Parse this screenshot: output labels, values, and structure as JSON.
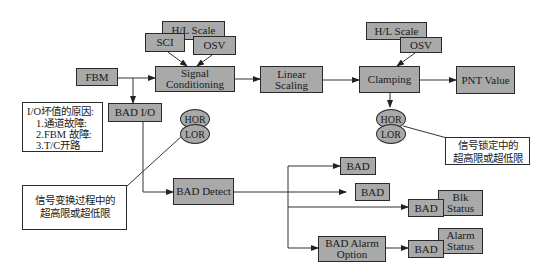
{
  "diagram": {
    "blocks": {
      "hl_scale_1": "H/L Scale",
      "sci": "SCI",
      "osv_1": "OSV",
      "fbm": "FBM",
      "signal_conditioning_l1": "Signal",
      "signal_conditioning_l2": "Conditioning",
      "linear_scaling": "Linear Scaling",
      "clamping": "Clamping",
      "hl_scale_2": "H/L Scale",
      "osv_2": "OSV",
      "pnt_value": "PNT Value",
      "bad_io": "BAD I/O",
      "hor_1": "HOR",
      "lor_1": "LOR",
      "hor_2": "HOR",
      "lor_2": "LOR",
      "bad_detect": "BAD Detect",
      "bad_1": "BAD",
      "bad_2": "BAD",
      "bad_3": "BAD",
      "blk_status_l1": "Blk",
      "blk_status_l2": "Status",
      "bad_alarm_option_l1": "BAD Alarm",
      "bad_alarm_option_l2": "Option",
      "bad_4": "BAD",
      "alarm_status_l1": "Alarm",
      "alarm_status_l2": "Status"
    },
    "notes": {
      "io_reasons": {
        "title": "I/O坏值的原因:",
        "items": [
          "1.通道故障:",
          "2.FBM 故障:",
          "3.T/C开路"
        ]
      },
      "conversion_note_l1": "信号变换过程中的",
      "conversion_note_l2": "超高限或超低限",
      "clamp_note_l1": "信号锁定中的",
      "clamp_note_l2": "超高限或超低限"
    }
  }
}
